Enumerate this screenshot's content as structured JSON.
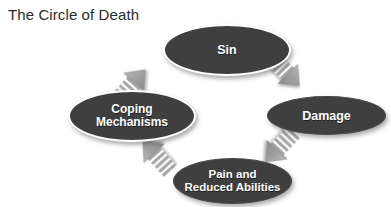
{
  "title": "The Circle of Death",
  "diagram": {
    "type": "cycle",
    "background_color": "#ffffff",
    "node_fill_color": "#3f3f3f",
    "node_text_color": "#ffffff",
    "arrow_color": "#9a9a9a",
    "nodes": [
      {
        "id": "sin",
        "label": "Sin",
        "position": "top",
        "outlined": true
      },
      {
        "id": "damage",
        "label": "Damage",
        "position": "right",
        "outlined": false
      },
      {
        "id": "pain",
        "label": "Pain and\nReduced Abilities",
        "line1": "Pain and",
        "line2": "Reduced Abilities",
        "position": "bottom",
        "outlined": false
      },
      {
        "id": "coping",
        "label": "Coping\nMechanisms",
        "line1": "Coping",
        "line2": "Mechanisms",
        "position": "left",
        "outlined": true
      }
    ],
    "arrows": [
      {
        "id": "sin-to-damage",
        "from": "sin",
        "to": "damage",
        "direction": "down-right"
      },
      {
        "id": "damage-to-pain",
        "from": "damage",
        "to": "pain",
        "direction": "down-left"
      },
      {
        "id": "pain-to-coping",
        "from": "pain",
        "to": "coping",
        "direction": "up-left"
      },
      {
        "id": "coping-to-sin",
        "from": "coping",
        "to": "sin",
        "direction": "up-right"
      }
    ]
  }
}
